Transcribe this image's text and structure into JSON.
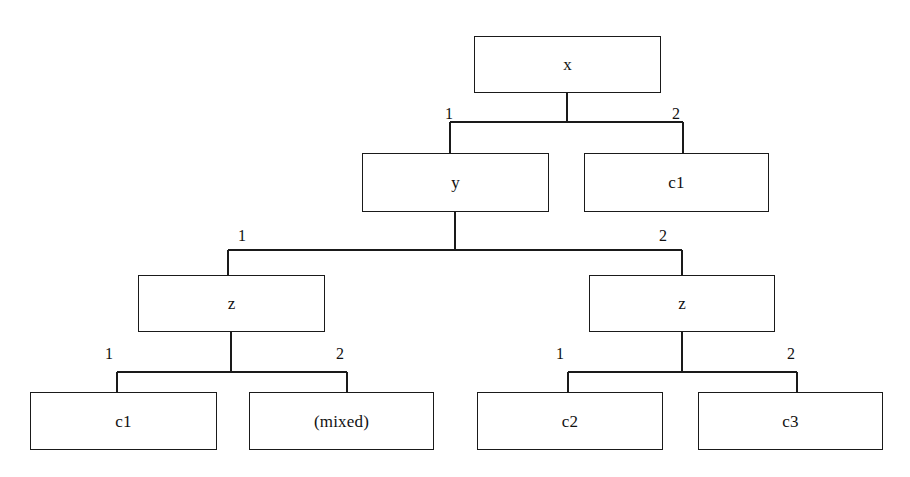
{
  "diagram": {
    "type": "tree",
    "title": "",
    "canvas": {
      "width": 910,
      "height": 477,
      "background": "#ffffff"
    },
    "style": {
      "box_fill": "#ffffff",
      "box_stroke": "#1a1a1a",
      "edge_stroke": "#1a1a1a",
      "text_color": "#111111"
    },
    "nodes": [
      {
        "id": "n-root",
        "label": "x",
        "level": 0,
        "x": 474,
        "y": 36,
        "w": 187,
        "h": 57
      },
      {
        "id": "n-y",
        "label": "y",
        "level": 1,
        "x": 362,
        "y": 153,
        "w": 187,
        "h": 59
      },
      {
        "id": "n-c1-top",
        "label": "c1",
        "level": 1,
        "x": 584,
        "y": 153,
        "w": 185,
        "h": 59
      },
      {
        "id": "n-z-left",
        "label": "z",
        "level": 2,
        "x": 138,
        "y": 275,
        "w": 187,
        "h": 57
      },
      {
        "id": "n-z-right",
        "label": "z",
        "level": 2,
        "x": 589,
        "y": 275,
        "w": 186,
        "h": 57
      },
      {
        "id": "n-c1",
        "label": "c1",
        "level": 3,
        "x": 30,
        "y": 392,
        "w": 187,
        "h": 58
      },
      {
        "id": "n-mixed",
        "label": "(mixed)",
        "level": 3,
        "x": 249,
        "y": 392,
        "w": 185,
        "h": 58
      },
      {
        "id": "n-c2",
        "label": "c2",
        "level": 3,
        "x": 477,
        "y": 392,
        "w": 186,
        "h": 58
      },
      {
        "id": "n-c3",
        "label": "c3",
        "level": 3,
        "x": 698,
        "y": 392,
        "w": 185,
        "h": 58
      }
    ],
    "edges": [
      {
        "id": "e-root-y",
        "from": "n-root",
        "to": "n-y",
        "label": "1"
      },
      {
        "id": "e-root-c1top",
        "from": "n-root",
        "to": "n-c1-top",
        "label": "2"
      },
      {
        "id": "e-y-zleft",
        "from": "n-y",
        "to": "n-z-left",
        "label": "1"
      },
      {
        "id": "e-y-zright",
        "from": "n-y",
        "to": "n-z-right",
        "label": "2"
      },
      {
        "id": "e-zleft-c1",
        "from": "n-z-left",
        "to": "n-c1",
        "label": "1"
      },
      {
        "id": "e-zleft-mixed",
        "from": "n-z-left",
        "to": "n-mixed",
        "label": "2"
      },
      {
        "id": "e-zright-c2",
        "from": "n-z-right",
        "to": "n-c2",
        "label": "1"
      },
      {
        "id": "e-zright-c3",
        "from": "n-z-right",
        "to": "n-c3",
        "label": "2"
      }
    ],
    "edge_labels": [
      {
        "id": "lbl-root-1",
        "text": "1",
        "x": 445,
        "y": 106
      },
      {
        "id": "lbl-root-2",
        "text": "2",
        "x": 672,
        "y": 106
      },
      {
        "id": "lbl-y-1",
        "text": "1",
        "x": 238,
        "y": 228
      },
      {
        "id": "lbl-y-2",
        "text": "2",
        "x": 659,
        "y": 228
      },
      {
        "id": "lbl-zleft-1",
        "text": "1",
        "x": 105,
        "y": 346
      },
      {
        "id": "lbl-zleft-2",
        "text": "2",
        "x": 336,
        "y": 346
      },
      {
        "id": "lbl-zright-1",
        "text": "1",
        "x": 556,
        "y": 346
      },
      {
        "id": "lbl-zright-2",
        "text": "2",
        "x": 787,
        "y": 346
      }
    ],
    "connectors": [
      {
        "id": "c-root",
        "stem_x": 567,
        "stem_top": 93,
        "bar_y": 122,
        "bar_left": 450,
        "bar_right": 683,
        "drops": [
          450,
          683
        ],
        "child_top": 153
      },
      {
        "id": "c-y",
        "stem_x": 455,
        "stem_top": 212,
        "bar_y": 250,
        "bar_left": 228,
        "bar_right": 682,
        "drops": [
          228,
          682
        ],
        "child_top": 275
      },
      {
        "id": "c-z-left",
        "stem_x": 231,
        "stem_top": 332,
        "bar_y": 372,
        "bar_left": 117,
        "bar_right": 347,
        "drops": [
          117,
          347
        ],
        "child_top": 392
      },
      {
        "id": "c-z-right",
        "stem_x": 682,
        "stem_top": 332,
        "bar_y": 372,
        "bar_left": 568,
        "bar_right": 797,
        "drops": [
          568,
          797
        ],
        "child_top": 392
      }
    ]
  }
}
